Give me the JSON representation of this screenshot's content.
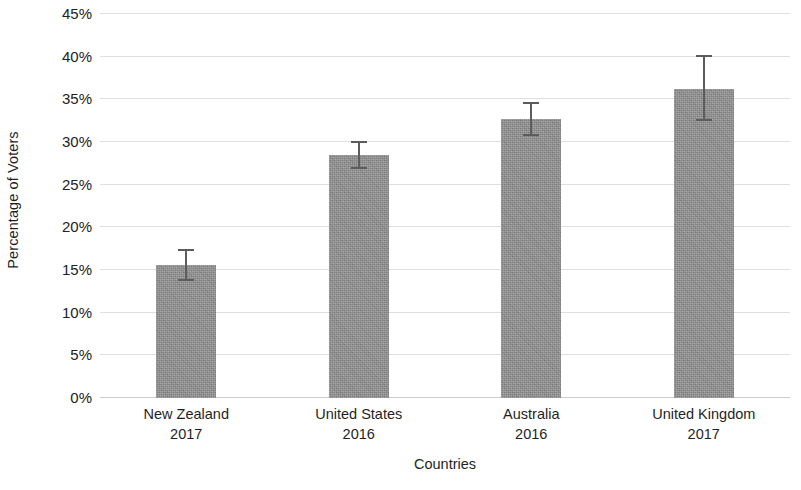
{
  "chart_data": {
    "type": "bar",
    "title": "",
    "subtitle": "",
    "xlabel": "Countries",
    "ylabel": "Percentage of Voters",
    "categories": [
      "New Zealand\n2017",
      "United States\n2016",
      "Australia\n2016",
      "United Kingdom\n2017"
    ],
    "category_lines": [
      {
        "country": "New Zealand",
        "year": "2017"
      },
      {
        "country": "United States",
        "year": "2016"
      },
      {
        "country": "Australia",
        "year": "2016"
      },
      {
        "country": "United Kingdom",
        "year": "2017"
      }
    ],
    "values": [
      15.5,
      28.4,
      32.6,
      36.1
    ],
    "errors_upper": [
      17.4,
      30.0,
      34.6,
      40.1
    ],
    "errors_lower": [
      13.6,
      26.7,
      30.6,
      32.3
    ],
    "error_plus": [
      1.9,
      1.6,
      2.0,
      4.0
    ],
    "error_minus": [
      1.9,
      1.7,
      2.0,
      3.8
    ],
    "value_unit": "%",
    "ylim": [
      0,
      45
    ],
    "ytick_values": [
      45,
      40,
      35,
      30,
      25,
      20,
      15,
      10,
      5,
      0
    ],
    "ytick_labels": [
      "45%",
      "40%",
      "35%",
      "30%",
      "25%",
      "20%",
      "15%",
      "10%",
      "5%",
      "0%"
    ],
    "grid": true,
    "grid_axis": "y",
    "legend": false,
    "legend_position": "none",
    "bar_color": "#8c8c8c",
    "errorbar_color": "#5c5c5c",
    "gridline_color": "#dcdfe3",
    "text_color": "#1f1f1f",
    "background_color": "#ffffff"
  }
}
